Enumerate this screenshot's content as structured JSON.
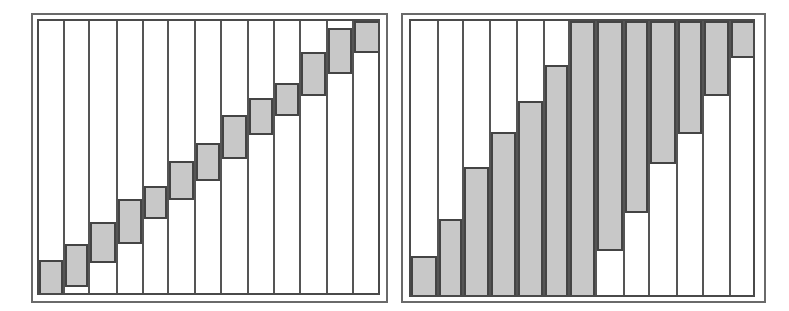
{
  "colors": {
    "fill": "#c8c8c8",
    "line": "#444444",
    "background": "#ffffff"
  },
  "panels": [
    {
      "name": "left-staircase-panel",
      "outer": {
        "x": 31,
        "y": 13,
        "w": 357,
        "h": 290
      },
      "inner": {
        "x": 37,
        "y": 19,
        "w": 343,
        "h": 276
      },
      "columns": [
        0,
        26,
        51,
        79,
        105,
        130,
        157,
        183,
        210,
        236,
        262,
        289,
        315,
        343
      ],
      "cells": [
        {
          "top": 239,
          "bottom": 276
        },
        {
          "top": 223,
          "bottom": 266
        },
        {
          "top": 201,
          "bottom": 242
        },
        {
          "top": 178,
          "bottom": 223
        },
        {
          "top": 165,
          "bottom": 198
        },
        {
          "top": 140,
          "bottom": 179
        },
        {
          "top": 122,
          "bottom": 160
        },
        {
          "top": 94,
          "bottom": 138
        },
        {
          "top": 77,
          "bottom": 114
        },
        {
          "top": 62,
          "bottom": 95
        },
        {
          "top": 31,
          "bottom": 75
        },
        {
          "top": 7,
          "bottom": 53
        },
        {
          "top": 0,
          "bottom": 32
        }
      ]
    },
    {
      "name": "right-band-panel",
      "outer": {
        "x": 401,
        "y": 13,
        "w": 365,
        "h": 290
      },
      "inner": {
        "x": 409,
        "y": 19,
        "w": 346,
        "h": 278
      },
      "columns": [
        0,
        28,
        53,
        80,
        107,
        134,
        159,
        186,
        214,
        239,
        267,
        293,
        320,
        346
      ],
      "cells": [
        {
          "top": 235,
          "bottom": 278
        },
        {
          "top": 198,
          "bottom": 278
        },
        {
          "top": 146,
          "bottom": 278
        },
        {
          "top": 111,
          "bottom": 278
        },
        {
          "top": 80,
          "bottom": 278
        },
        {
          "top": 44,
          "bottom": 278
        },
        {
          "top": 0,
          "bottom": 278
        },
        {
          "top": 0,
          "bottom": 230
        },
        {
          "top": 0,
          "bottom": 192
        },
        {
          "top": 0,
          "bottom": 143
        },
        {
          "top": 0,
          "bottom": 113
        },
        {
          "top": 0,
          "bottom": 75
        },
        {
          "top": 0,
          "bottom": 37
        }
      ]
    }
  ]
}
